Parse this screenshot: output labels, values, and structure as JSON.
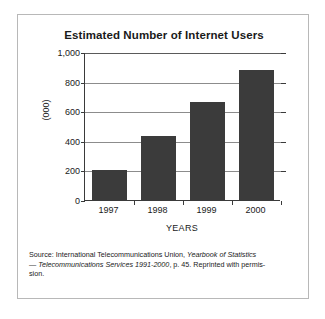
{
  "chart_data": {
    "type": "bar",
    "title": "Estimated Number of Internet Users",
    "categories": [
      "1997",
      "1998",
      "1999",
      "2000"
    ],
    "values": [
      205,
      430,
      660,
      880
    ],
    "xlabel": "YEARS",
    "ylabel": "(000)",
    "ylim": [
      0,
      1000
    ],
    "ytick_labels": [
      "0",
      "200",
      "400",
      "600",
      "800",
      "1,000"
    ],
    "ytick_values": [
      0,
      200,
      400,
      600,
      800,
      1000
    ],
    "grid": true,
    "legend": false,
    "bar_color": "#3b3b3b",
    "axis_color": "#3a3a3a",
    "grid_color": "#8c8c8c"
  },
  "caption": {
    "line1_prefix": "Source: International Telecommunications Union, ",
    "line1_italic": "Yearbook of Statistics",
    "line2_dash": "— ",
    "line2_italic": "Telecommunications Services 1991-2000",
    "line2_suffix": ", p. 45. Reprinted with permis-",
    "line3": "sion."
  }
}
